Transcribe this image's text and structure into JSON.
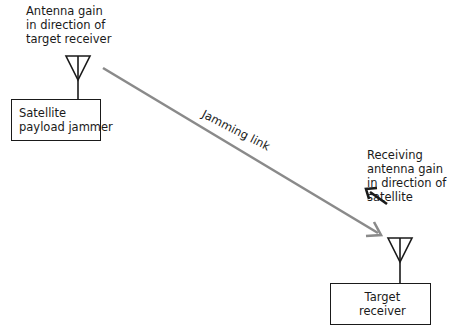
{
  "jammer": {
    "antenna_label": "Antenna gain\nin direction of\ntarget receiver",
    "box_label": "Satellite\npayload jammer"
  },
  "link": {
    "label": "Jamming link",
    "color": "#8a8a8a"
  },
  "receiver": {
    "antenna_label": "Receiving\nantenna gain\nin direction of\nsatellite",
    "box_label": "Target\nreceiver"
  },
  "colors": {
    "stroke": "#1a1a1a",
    "link": "#8a8a8a"
  }
}
